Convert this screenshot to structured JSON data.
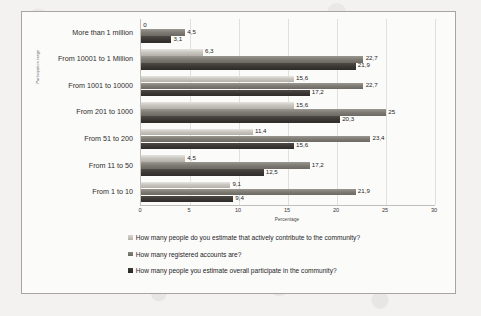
{
  "chart_data": {
    "type": "bar",
    "orientation": "horizontal",
    "title": "",
    "xlabel": "Percentage",
    "ylabel": "Participation range",
    "xlim": [
      0,
      30
    ],
    "xticks": [
      "0",
      "5",
      "10",
      "15",
      "20",
      "25",
      "30"
    ],
    "grid": true,
    "legend_position": "bottom",
    "categories": [
      "More than 1 million",
      "From 10001 to 1 Million",
      "From 1001 to 10000",
      "From 201 to 1000",
      "From 51 to 200",
      "From 11 to 50",
      "From 1 to 10"
    ],
    "series": [
      {
        "name": "How many people do you estimate that actively contribute to the community?",
        "swatch": "light-gray",
        "color": "#c9c6c0",
        "values": [
          0,
          6.3,
          15.6,
          15.6,
          11.4,
          4.5,
          9.1
        ],
        "labels": [
          "0",
          "6,3",
          "15,6",
          "15,6",
          "11,4",
          "4,5",
          "9,1"
        ]
      },
      {
        "name": "How many registered accounts are?",
        "swatch": "mid-gray",
        "color": "#7e7a74",
        "values": [
          4.5,
          22.7,
          22.7,
          25,
          23.4,
          17.2,
          21.9
        ],
        "labels": [
          "4,5",
          "22,7",
          "22,7",
          "25",
          "23,4",
          "17,2",
          "21,9"
        ]
      },
      {
        "name": "How many people you estimate overall participate in the community?",
        "swatch": "dark-gray",
        "color": "#3a3734",
        "values": [
          3.1,
          21.9,
          17.2,
          20.3,
          15.6,
          12.5,
          9.4
        ],
        "labels": [
          "3,1",
          "21,9",
          "17,2",
          "20,3",
          "15,6",
          "12,5",
          "9,4"
        ]
      }
    ]
  }
}
